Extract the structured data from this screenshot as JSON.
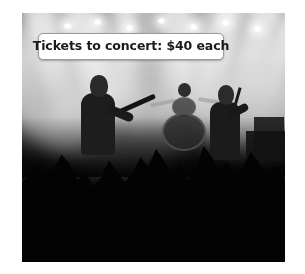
{
  "caption": {
    "text": "Tickets to concert: $40 each"
  },
  "photo": {
    "alt": "Rock concert: silhouetted band on a smoky, light-beam lit stage with a crowd of raised hands in the foreground",
    "scene_elements": [
      "stage-lights",
      "haze-smoke",
      "guitarist-silhouette",
      "drum-kit",
      "singer-with-microphone",
      "amplifier-stack",
      "crowd-raised-hands"
    ]
  },
  "colors": {
    "page_background": "#ffffff",
    "caption_background": "#ffffff",
    "caption_border": "#9b9b9b",
    "caption_text": "#1a1a1a",
    "photo_dark": "#030303",
    "photo_haze": "#a6a6a6"
  },
  "lamps": [
    {
      "x": 42,
      "y": 10
    },
    {
      "x": 72,
      "y": 6
    },
    {
      "x": 104,
      "y": 12
    },
    {
      "x": 136,
      "y": 5
    },
    {
      "x": 168,
      "y": 11
    },
    {
      "x": 200,
      "y": 7
    },
    {
      "x": 232,
      "y": 13
    }
  ],
  "crowd_arms": [
    {
      "x": 18,
      "y": 96,
      "w": 7,
      "h": 40,
      "rot": -12
    },
    {
      "x": 36,
      "y": 104,
      "w": 6,
      "h": 34,
      "rot": 8
    },
    {
      "x": 58,
      "y": 112,
      "w": 7,
      "h": 30,
      "rot": -6
    },
    {
      "x": 88,
      "y": 100,
      "w": 7,
      "h": 42,
      "rot": 10
    },
    {
      "x": 114,
      "y": 108,
      "w": 6,
      "h": 36,
      "rot": -9
    },
    {
      "x": 140,
      "y": 92,
      "w": 8,
      "h": 48,
      "rot": 5
    },
    {
      "x": 166,
      "y": 106,
      "w": 7,
      "h": 38,
      "rot": -14
    },
    {
      "x": 196,
      "y": 88,
      "w": 8,
      "h": 52,
      "rot": 7
    },
    {
      "x": 222,
      "y": 100,
      "w": 7,
      "h": 42,
      "rot": -5
    },
    {
      "x": 244,
      "y": 110,
      "w": 6,
      "h": 34,
      "rot": 12
    }
  ]
}
